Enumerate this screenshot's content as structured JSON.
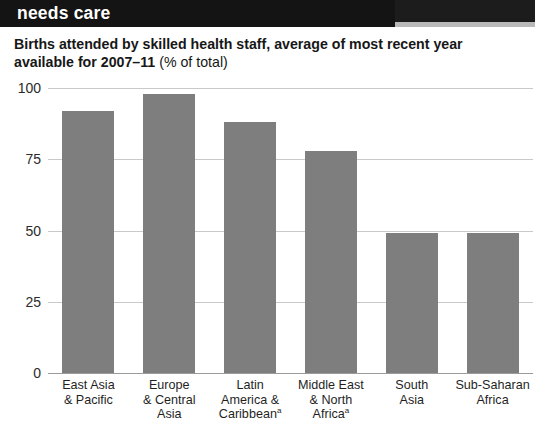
{
  "banner": {
    "title": "needs care"
  },
  "subtitle": {
    "bold_text": "Births attended by skilled health staff, average of most recent year available for 2007–11",
    "light_text": "(% of total)"
  },
  "colors": {
    "bar": "#7e7e7e",
    "banner_background": "#141414",
    "banner_text": "#ffffff",
    "gridline": "#c9c9c9",
    "axis": "#9a9a9a",
    "text": "#1a1a1a"
  },
  "chart_data": {
    "type": "bar",
    "title": "Births attended by skilled health staff, average of most recent year available for 2007–11 (% of total)",
    "xlabel": "",
    "ylabel": "",
    "ylim": [
      0,
      100
    ],
    "yticks": [
      0,
      25,
      50,
      75,
      100
    ],
    "ytick_labels": [
      "0",
      "25",
      "50",
      "75",
      "100"
    ],
    "grid": true,
    "legend": "none",
    "categories": [
      "East Asia & Pacific",
      "Europe & Central Asia",
      "Latin America & Caribbean",
      "Middle East & North Africa",
      "South Asia",
      "Sub-Saharan Africa"
    ],
    "category_lines": [
      [
        "East Asia",
        "& Pacific"
      ],
      [
        "Europe",
        "& Central",
        "Asia"
      ],
      [
        "Latin",
        "America &",
        "Caribbean"
      ],
      [
        "Middle East",
        "& North",
        "Africa"
      ],
      [
        "South",
        "Asia"
      ],
      [
        "Sub-Saharan",
        "Africa"
      ]
    ],
    "category_footnote_marks": [
      "",
      "",
      "a",
      "a",
      "",
      ""
    ],
    "values": [
      92,
      98,
      88,
      78,
      49,
      49
    ]
  }
}
